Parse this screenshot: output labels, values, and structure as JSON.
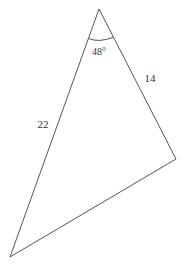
{
  "diagram": {
    "type": "triangle",
    "vertices": {
      "top": {
        "x": 99,
        "y": 9
      },
      "right": {
        "x": 176,
        "y": 159
      },
      "bottom_left": {
        "x": 10,
        "y": 257
      }
    },
    "sides": {
      "left": {
        "label": "22",
        "from": "top",
        "to": "bottom_left"
      },
      "right": {
        "label": "14",
        "from": "top",
        "to": "right"
      },
      "bottom": {
        "label": "",
        "from": "bottom_left",
        "to": "right"
      }
    },
    "angle": {
      "vertex": "top",
      "label": "48°"
    },
    "colors": {
      "stroke": "#555555",
      "text": "#333333",
      "background": "#ffffff"
    }
  }
}
